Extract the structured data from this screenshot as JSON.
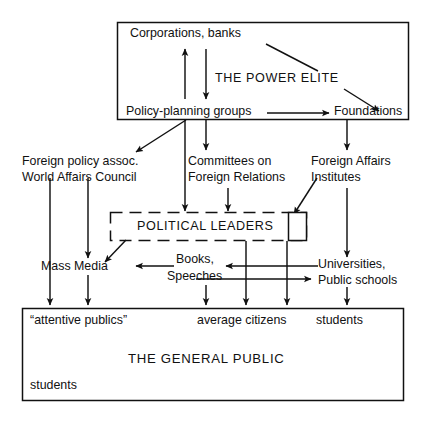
{
  "diagram": {
    "type": "influence-flow-diagram",
    "colors": {
      "ink": "#111111",
      "background": "#ffffff",
      "line": "#111111"
    },
    "boxes": {
      "power_elite": {
        "label": "THE POWER ELITE",
        "style": "solid-rectangle",
        "members": [
          "Corporations, banks",
          "Policy-planning groups",
          "Foundations"
        ]
      },
      "political_leaders": {
        "label": "POLITICAL LEADERS",
        "style": "dashed-rectangle"
      },
      "leaders_side_box": {
        "label": "",
        "style": "solid-rectangle-small"
      },
      "general_public": {
        "label": "THE GENERAL PUBLIC",
        "style": "solid-rectangle",
        "segments": [
          "“attentive publics”",
          "average citizens",
          "students",
          "students"
        ]
      }
    },
    "nodes": {
      "corporations": "Corporations, banks",
      "policy_planning": "Policy-planning groups",
      "foundations": "Foundations",
      "power_elite_caption": "THE POWER ELITE",
      "foreign_policy_line1": "Foreign policy assoc.",
      "foreign_policy_line2": "World Affairs Council",
      "committees_line1": "Committees on",
      "committees_line2": "Foreign Relations",
      "foreign_affairs_line1": "Foreign Affairs",
      "foreign_affairs_line2": "Institutes",
      "political_leaders": "POLITICAL LEADERS",
      "mass_media": "Mass Media",
      "books_line1": "Books,",
      "books_line2": "Speeches",
      "universities_line1": "Universities,",
      "universities_line2": "Public schools",
      "attentive_publics": "“attentive publics”",
      "average_citizens": "average citizens",
      "students_top": "students",
      "general_public": "THE GENERAL PUBLIC",
      "students_bottom": "students"
    },
    "arrows": [
      {
        "name": "policy-planning-to-corporations",
        "from": "Policy-planning groups",
        "to": "Corporations, banks",
        "direction": "up"
      },
      {
        "name": "corporations-to-policy-planning",
        "from": "Corporations, banks",
        "to": "Policy-planning groups",
        "direction": "down"
      },
      {
        "name": "policy-planning-to-foundations",
        "from": "Policy-planning groups",
        "to": "Foundations",
        "direction": "right"
      },
      {
        "name": "power-elite-to-foreign-policy-assoc",
        "from": "THE POWER ELITE",
        "to": "Foreign policy assoc. / World Affairs Council",
        "direction": "down-left"
      },
      {
        "name": "power-elite-to-committees",
        "from": "THE POWER ELITE",
        "to": "Committees on Foreign Relations",
        "direction": "down"
      },
      {
        "name": "power-elite-to-foreign-affairs-institutes",
        "from": "THE POWER ELITE",
        "to": "Foreign Affairs Institutes",
        "direction": "down"
      },
      {
        "name": "power-elite-to-political-leaders",
        "from": "THE POWER ELITE",
        "to": "POLITICAL LEADERS",
        "direction": "down"
      },
      {
        "name": "committees-to-political-leaders",
        "from": "Committees on Foreign Relations",
        "to": "POLITICAL LEADERS",
        "direction": "down"
      },
      {
        "name": "foreign-affairs-institutes-to-political-leaders",
        "from": "Foreign Affairs Institutes",
        "to": "POLITICAL LEADERS",
        "direction": "down-left"
      },
      {
        "name": "political-leaders-to-mass-media",
        "from": "POLITICAL LEADERS",
        "to": "Mass Media",
        "direction": "down-left"
      },
      {
        "name": "books-to-mass-media",
        "from": "Books, Speeches",
        "to": "Mass Media",
        "direction": "left"
      },
      {
        "name": "universities-to-books",
        "from": "Universities, Public schools",
        "to": "Books, Speeches",
        "direction": "left"
      },
      {
        "name": "books-to-universities",
        "from": "Books, Speeches",
        "to": "Universities, Public schools",
        "direction": "right"
      },
      {
        "name": "foreign-policy-assoc-to-public",
        "from": "Foreign policy assoc.",
        "to": "THE GENERAL PUBLIC",
        "direction": "down"
      },
      {
        "name": "world-affairs-council-to-mass-media",
        "from": "World Affairs Council",
        "to": "Mass Media",
        "direction": "down"
      },
      {
        "name": "mass-media-to-public",
        "from": "Mass Media",
        "to": "THE GENERAL PUBLIC",
        "direction": "down"
      },
      {
        "name": "books-to-public",
        "from": "Books, Speeches",
        "to": "THE GENERAL PUBLIC",
        "direction": "down"
      },
      {
        "name": "political-leaders-to-public-center",
        "from": "POLITICAL LEADERS",
        "to": "THE GENERAL PUBLIC",
        "direction": "down"
      },
      {
        "name": "political-leaders-to-public-right",
        "from": "POLITICAL LEADERS",
        "to": "THE GENERAL PUBLIC",
        "direction": "down"
      },
      {
        "name": "universities-to-public",
        "from": "Universities, Public schools",
        "to": "THE GENERAL PUBLIC",
        "direction": "down"
      }
    ]
  }
}
